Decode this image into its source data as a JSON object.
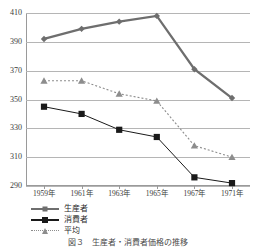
{
  "chart_data": {
    "type": "line",
    "title": "",
    "xlabel": "",
    "ylabel": "",
    "categories": [
      "1959年",
      "1961年",
      "1963年",
      "1965年",
      "1967年",
      "1971年"
    ],
    "ylim": [
      290,
      410
    ],
    "yticks": [
      290,
      310,
      330,
      350,
      370,
      390,
      410
    ],
    "ytick_labels": [
      "290",
      "310",
      "330",
      "350",
      "370",
      "390",
      "410"
    ],
    "grid": true,
    "legend_position": "bottom-left",
    "series": [
      {
        "name": "生産者",
        "marker": "diamond",
        "line_style": "solid",
        "color": "#6e6e6e",
        "values": [
          392,
          399,
          404,
          408,
          371,
          351
        ]
      },
      {
        "name": "消費者",
        "marker": "square",
        "line_style": "solid",
        "color": "#1a1a1a",
        "values": [
          345,
          340,
          329,
          324,
          296,
          292
        ]
      },
      {
        "name": "平均",
        "marker": "triangle",
        "line_style": "dotted",
        "color": "#8d8d8d",
        "values": [
          363,
          363,
          354,
          349,
          318,
          310
        ]
      }
    ]
  },
  "caption": {
    "text": "図３　生産者・消費者価格の推移"
  }
}
